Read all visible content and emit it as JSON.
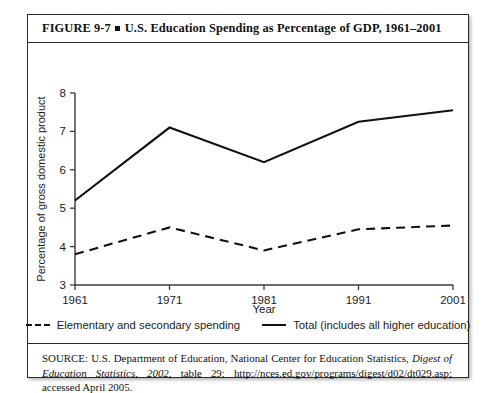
{
  "figure": {
    "number": "FIGURE 9-7",
    "bullet": "square-bullet",
    "title": "U.S. Education Spending as Percentage of GDP, 1961–2001"
  },
  "source": {
    "prefix": "SOURCE: U.S. Department of Education, National Center for Education Statistics, ",
    "italic_part": "Digest of Education Statistics, 2002",
    "suffix": ", table 29; http://nces.ed.gov/programs/digest/d02/dt029.asp; accessed April 2005."
  },
  "chart_data": {
    "type": "line",
    "title": "U.S. Education Spending as Percentage of GDP, 1961–2001",
    "xlabel": "Year",
    "ylabel": "Percentage of gross domestic product",
    "x": [
      1961,
      1971,
      1981,
      1991,
      2001
    ],
    "xticklabels": [
      "1961",
      "1971",
      "1981",
      "1991",
      "2001"
    ],
    "yticks": [
      3,
      4,
      5,
      6,
      7,
      8
    ],
    "yticklabels": [
      "3",
      "4",
      "5",
      "6",
      "7",
      "8"
    ],
    "ylim": [
      3,
      8
    ],
    "xlim": [
      1961,
      2001
    ],
    "grid": false,
    "legend_position": "below-axes",
    "series": [
      {
        "name": "Elementary and secondary spending",
        "style": "dashed",
        "color": "#111111",
        "values": [
          3.8,
          4.5,
          3.9,
          4.45,
          4.55
        ]
      },
      {
        "name": "Total (includes all higher education)",
        "style": "solid",
        "color": "#111111",
        "values": [
          5.2,
          7.1,
          6.2,
          7.25,
          7.55
        ]
      }
    ]
  }
}
